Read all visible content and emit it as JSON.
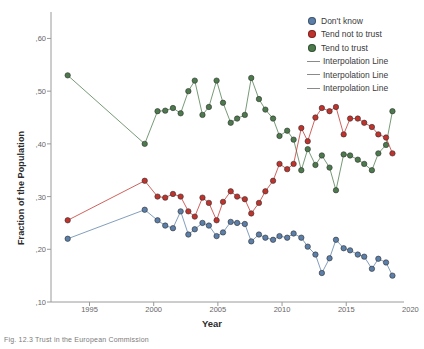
{
  "figure": {
    "caption": "Fig. 12.3  Trust in the European Commission",
    "xlabel": "Year",
    "ylabel": "Fraction of the Population"
  },
  "legend": {
    "position": "top-right",
    "entries": [
      {
        "label": "Don't know",
        "type": "marker",
        "color": "#5b7fa8"
      },
      {
        "label": "Tend not to trust",
        "type": "marker",
        "color": "#c0322c"
      },
      {
        "label": "Tend to trust",
        "type": "marker",
        "color": "#4c7a4c"
      },
      {
        "label": "Interpolation Line",
        "type": "line",
        "color": "#8a8a8a"
      },
      {
        "label": "Interpolation Line",
        "type": "line",
        "color": "#8a8a8a"
      },
      {
        "label": "Interpolation Line",
        "type": "line",
        "color": "#8a8a8a"
      }
    ]
  },
  "chart_data": {
    "type": "line",
    "title": "",
    "xlabel": "Year",
    "ylabel": "Fraction of the Population",
    "xlim": [
      1992.0,
      2019.5
    ],
    "ylim": [
      0.1,
      0.635
    ],
    "xticks": [
      1995,
      2000,
      2005,
      2010,
      2015,
      2020
    ],
    "yticks": [
      0.1,
      0.2,
      0.3,
      0.4,
      0.5,
      0.6
    ],
    "ytick_labels": [
      ",10",
      ",20",
      ",30",
      ",40",
      ",50",
      ",60"
    ],
    "xtick_labels": [
      "1995",
      "2000",
      "2005",
      "2010",
      "2015",
      "2020"
    ],
    "grid": false,
    "decimal_separator": ",",
    "series": [
      {
        "name": "Tend to trust",
        "color": "#4c7a4c",
        "x": [
          1993.3,
          1999.3,
          2000.3,
          2000.9,
          2001.5,
          2002.1,
          2002.7,
          2003.2,
          2003.8,
          2004.3,
          2004.9,
          2005.4,
          2006.0,
          2006.5,
          2007.1,
          2007.6,
          2008.2,
          2008.7,
          2009.3,
          2009.8,
          2010.4,
          2010.9,
          2011.5,
          2012.0,
          2012.6,
          2013.1,
          2013.7,
          2014.2,
          2014.8,
          2015.3,
          2015.9,
          2016.4,
          2017.0,
          2017.5,
          2018.1,
          2018.6
        ],
        "y": [
          0.53,
          0.4,
          0.462,
          0.463,
          0.468,
          0.458,
          0.5,
          0.52,
          0.455,
          0.47,
          0.52,
          0.478,
          0.44,
          0.448,
          0.455,
          0.525,
          0.485,
          0.465,
          0.448,
          0.415,
          0.425,
          0.408,
          0.35,
          0.39,
          0.36,
          0.378,
          0.355,
          0.312,
          0.38,
          0.378,
          0.37,
          0.362,
          0.35,
          0.382,
          0.398,
          0.462
        ]
      },
      {
        "name": "Tend not to trust",
        "color": "#c0322c",
        "x": [
          1993.3,
          1999.3,
          2000.3,
          2000.9,
          2001.5,
          2002.1,
          2002.7,
          2003.2,
          2003.8,
          2004.3,
          2004.9,
          2005.4,
          2006.0,
          2006.5,
          2007.1,
          2007.6,
          2008.2,
          2008.7,
          2009.3,
          2009.8,
          2010.4,
          2010.9,
          2011.5,
          2012.0,
          2012.6,
          2013.1,
          2013.7,
          2014.2,
          2014.8,
          2015.3,
          2015.9,
          2016.4,
          2017.0,
          2017.5,
          2018.1,
          2018.6
        ],
        "y": [
          0.255,
          0.33,
          0.3,
          0.298,
          0.305,
          0.3,
          0.272,
          0.262,
          0.298,
          0.288,
          0.255,
          0.29,
          0.31,
          0.3,
          0.295,
          0.268,
          0.288,
          0.31,
          0.33,
          0.362,
          0.352,
          0.362,
          0.43,
          0.405,
          0.45,
          0.468,
          0.462,
          0.47,
          0.418,
          0.448,
          0.448,
          0.44,
          0.432,
          0.418,
          0.412,
          0.382
        ]
      },
      {
        "name": "Don't know",
        "color": "#5b7fa8",
        "x": [
          1993.3,
          1999.3,
          2000.3,
          2000.9,
          2001.5,
          2002.1,
          2002.7,
          2003.2,
          2003.8,
          2004.3,
          2004.9,
          2005.4,
          2006.0,
          2006.5,
          2007.1,
          2007.6,
          2008.2,
          2008.7,
          2009.3,
          2009.8,
          2010.4,
          2010.9,
          2011.5,
          2012.0,
          2012.6,
          2013.1,
          2013.7,
          2014.2,
          2014.8,
          2015.3,
          2015.9,
          2016.4,
          2017.0,
          2017.5,
          2018.1,
          2018.6
        ],
        "y": [
          0.22,
          0.275,
          0.255,
          0.245,
          0.24,
          0.272,
          0.228,
          0.238,
          0.25,
          0.245,
          0.225,
          0.232,
          0.252,
          0.25,
          0.248,
          0.215,
          0.228,
          0.222,
          0.218,
          0.225,
          0.222,
          0.23,
          0.222,
          0.205,
          0.19,
          0.155,
          0.183,
          0.218,
          0.202,
          0.198,
          0.19,
          0.186,
          0.163,
          0.182,
          0.175,
          0.15
        ]
      }
    ]
  }
}
